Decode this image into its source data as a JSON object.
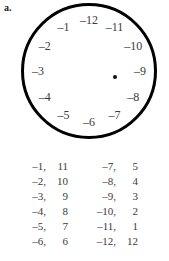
{
  "figure": {
    "parts": {
      "a_label": "a.",
      "b_label": "b."
    }
  },
  "clock": {
    "center_marker": "•",
    "positions": [
      {
        "hour_slot": 12,
        "label": "–12",
        "angle_deg": 0
      },
      {
        "hour_slot": 1,
        "label": "–11",
        "angle_deg": 30
      },
      {
        "hour_slot": 2,
        "label": "–10",
        "angle_deg": 60
      },
      {
        "hour_slot": 3,
        "label": "–9",
        "angle_deg": 90
      },
      {
        "hour_slot": 4,
        "label": "–8",
        "angle_deg": 120
      },
      {
        "hour_slot": 5,
        "label": "–7",
        "angle_deg": 150
      },
      {
        "hour_slot": 6,
        "label": "–6",
        "angle_deg": 180
      },
      {
        "hour_slot": 7,
        "label": "–5",
        "angle_deg": 210
      },
      {
        "hour_slot": 8,
        "label": "–4",
        "angle_deg": 240
      },
      {
        "hour_slot": 9,
        "label": "–3",
        "angle_deg": 270
      },
      {
        "hour_slot": 10,
        "label": "–2",
        "angle_deg": 300
      },
      {
        "hour_slot": 11,
        "label": "–1",
        "angle_deg": 330
      }
    ]
  },
  "pairs_table": {
    "columns": [
      {
        "rows": [
          {
            "first": "–1,",
            "second": "11"
          },
          {
            "first": "–2,",
            "second": "10"
          },
          {
            "first": "–3,",
            "second": "9"
          },
          {
            "first": "–4,",
            "second": "8"
          },
          {
            "first": "–5,",
            "second": "7"
          },
          {
            "first": "–6,",
            "second": "6"
          }
        ]
      },
      {
        "rows": [
          {
            "first": "–7,",
            "second": "5"
          },
          {
            "first": "–8,",
            "second": "4"
          },
          {
            "first": "–9,",
            "second": "3"
          },
          {
            "first": "–10,",
            "second": "2"
          },
          {
            "first": "–11,",
            "second": "1"
          },
          {
            "first": "–12,",
            "second": "12"
          }
        ]
      }
    ]
  },
  "colors": {
    "circle_stroke": "#000000",
    "text": "#3a3a3a",
    "label_text": "#1c1c1c",
    "background": "#ffffff"
  }
}
